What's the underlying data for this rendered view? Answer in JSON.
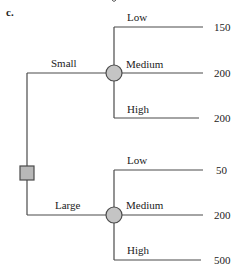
{
  "part_label": "c.",
  "tree": {
    "root": {
      "type": "decision",
      "shape": "square",
      "fill": "#b8b8b8"
    },
    "branches": [
      {
        "label": "Small",
        "node": {
          "type": "chance",
          "shape": "circle",
          "fill": "#c4c4c4"
        },
        "outcomes": [
          {
            "label": "Low",
            "value": "150"
          },
          {
            "label": "Medium",
            "value": "200"
          },
          {
            "label": "High",
            "value": "200"
          }
        ]
      },
      {
        "label": "Large",
        "node": {
          "type": "chance",
          "shape": "circle",
          "fill": "#c4c4c4"
        },
        "outcomes": [
          {
            "label": "Low",
            "value": "50"
          },
          {
            "label": "Medium",
            "value": "200"
          },
          {
            "label": "High",
            "value": "500"
          }
        ]
      }
    ]
  },
  "colors": {
    "line": "#4a4a4a",
    "node_fill": "#c4c4c4",
    "text": "#222222"
  }
}
